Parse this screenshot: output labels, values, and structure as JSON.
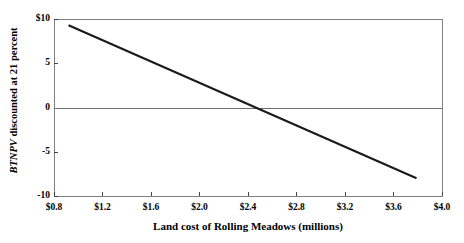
{
  "chart_data": {
    "type": "line",
    "title": "",
    "xlabel": "Land cost of Rolling Meadows (millions)",
    "ylabel_italic_part": "BTNPV",
    "ylabel_rest": " discounted at 21 percent",
    "ylabel_full": "BTNPV discounted at 21 percent",
    "xlim": [
      0.8,
      4.0
    ],
    "ylim": [
      -10,
      10
    ],
    "xticks": [
      0.8,
      1.2,
      1.6,
      2.0,
      2.4,
      2.8,
      3.2,
      3.6,
      4.0
    ],
    "xtick_labels": [
      "$0.8",
      "$1.2",
      "$1.6",
      "$2.0",
      "$2.4",
      "$2.8",
      "$3.2",
      "$3.6",
      "$4.0"
    ],
    "yticks": [
      10,
      5,
      0,
      -5,
      -10
    ],
    "ytick_labels": [
      "$10",
      "5",
      "0",
      "-5",
      "-10"
    ],
    "grid": false,
    "zero_line": true,
    "legend": "none",
    "line_color": "#1a1a1a",
    "zero_line_color": "#6e6e6e",
    "frame_color": "#808080",
    "series": [
      {
        "name": "BTNPV vs land cost",
        "x": [
          0.92,
          3.79
        ],
        "values": [
          9.3,
          -8.0
        ],
        "x_intercept": 2.47,
        "slope": -6.03
      }
    ],
    "annotations": []
  },
  "figure": {
    "background": "#ffffff"
  }
}
